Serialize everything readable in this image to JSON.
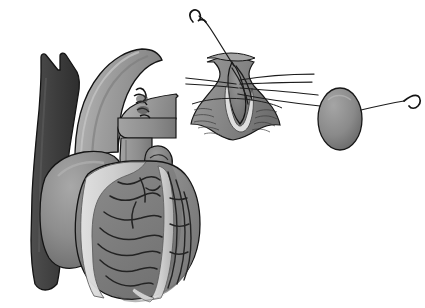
{
  "figure": {
    "background_color": "#ffffff",
    "width": 425,
    "height": 308,
    "style": "grayscale medical line-and-wash illustration",
    "text_labels": []
  },
  "palette": {
    "background": "#ffffff",
    "outline": "#1a1a1a",
    "vein_dark": "#3c3c3c",
    "vena_cava_dark": "#464646",
    "aorta_mid": "#969696",
    "aorta_light": "#b4b4b4",
    "atrium_gray": "#8a8a8a",
    "atrium_shadow": "#6e6e6e",
    "myocardium": "#7d7d7d",
    "myocardium_light": "#909090",
    "epicardial_fat": "#d8d8d8",
    "fat_shadow": "#bdbdbd",
    "coronary_line": "#2a2a2a",
    "lumen_pale": "#dcdcdc",
    "vessel_wall": "#8e8e8e",
    "graft_oval": "#8c8c8c",
    "graft_oval_shadow": "#6a6a6a",
    "suture_thread": "#202020",
    "needle": "#171717"
  },
  "heart_panel": {
    "name": "anterior heart view",
    "position": {
      "x": 8,
      "y": 48,
      "width": 200,
      "height": 252
    },
    "structures": [
      {
        "id": "superior-vena-cava",
        "label": "Superior vena cava with brachiocephalic branches",
        "tone": "vena_cava_dark"
      },
      {
        "id": "aortic-arch",
        "label": "Ascending aorta and aortic arch",
        "tone": "aorta_mid"
      },
      {
        "id": "pulmonary-trunk",
        "label": "Pulmonary trunk",
        "tone": "aorta_mid"
      },
      {
        "id": "right-atrium",
        "label": "Right atrium",
        "tone": "atrium_gray"
      },
      {
        "id": "left-atrial-appendage",
        "label": "Left atrial appendage",
        "tone": "atrium_shadow"
      },
      {
        "id": "right-ventricle",
        "label": "Right ventricle myocardium",
        "tone": "myocardium"
      },
      {
        "id": "left-ventricle",
        "label": "Left ventricle myocardium",
        "tone": "myocardium_light"
      },
      {
        "id": "epicardial-fat-band",
        "label": "Epicardial fat along interventricular groove",
        "tone": "epicardial_fat"
      },
      {
        "id": "coronary-arteries",
        "label": "Epicardial coronary artery branches",
        "tone": "coronary_line"
      },
      {
        "id": "proximal-anastomosis",
        "label": "Proximal graft anastomosis on ascending aorta",
        "tone": "suture_thread"
      }
    ]
  },
  "inset_panel": {
    "name": "anastomosis detail inset",
    "position": {
      "x": 186,
      "y": 6,
      "width": 236,
      "height": 144
    },
    "structures": [
      {
        "id": "coronary-arteriotomy",
        "label": "Opened coronary artery (arteriotomy)",
        "tone": "vessel_wall"
      },
      {
        "id": "arteriotomy-lumen",
        "label": "Exposed vessel lumen",
        "tone": "lumen_pale"
      },
      {
        "id": "vein-graft-oval",
        "label": "Vein graft end viewed en face",
        "tone": "graft_oval"
      },
      {
        "id": "parachute-sutures",
        "label": "Parachute suture threads",
        "tone": "suture_thread"
      },
      {
        "id": "needle-upper-left",
        "label": "Curved surgical needle, upper left",
        "tone": "needle"
      },
      {
        "id": "needle-right",
        "label": "Curved surgical needle, right",
        "tone": "needle"
      }
    ],
    "suture_count": 6
  }
}
